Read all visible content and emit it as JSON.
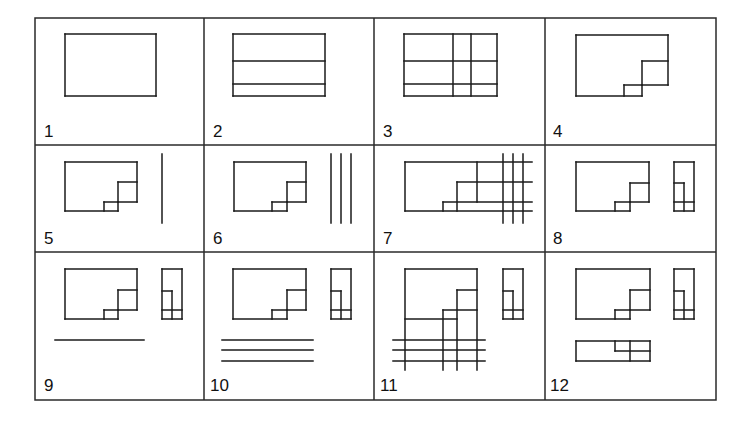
{
  "figure": {
    "grid": {
      "x": 35,
      "y": 18,
      "width": 681,
      "height": 382,
      "col_lines": [
        204,
        374,
        545
      ],
      "row_lines": [
        145,
        252
      ]
    },
    "panels": [
      {
        "label": "1",
        "label_pos": [
          44,
          137
        ],
        "lines": [
          [
            65,
            34,
            156,
            34
          ],
          [
            156,
            34,
            156,
            96
          ],
          [
            156,
            96,
            65,
            96
          ],
          [
            65,
            96,
            65,
            34
          ]
        ]
      },
      {
        "label": "2",
        "label_pos": [
          213,
          137
        ],
        "lines": [
          [
            233,
            34,
            325,
            34
          ],
          [
            325,
            34,
            325,
            96
          ],
          [
            325,
            96,
            233,
            96
          ],
          [
            233,
            96,
            233,
            34
          ],
          [
            233,
            61,
            325,
            61
          ],
          [
            233,
            84,
            325,
            84
          ]
        ]
      },
      {
        "label": "3",
        "label_pos": [
          383,
          137
        ],
        "lines": [
          [
            404,
            34,
            497,
            34
          ],
          [
            497,
            34,
            497,
            96
          ],
          [
            497,
            96,
            404,
            96
          ],
          [
            404,
            96,
            404,
            34
          ],
          [
            404,
            61,
            497,
            61
          ],
          [
            404,
            84,
            497,
            84
          ],
          [
            453,
            34,
            453,
            96
          ],
          [
            471,
            34,
            471,
            96
          ]
        ]
      },
      {
        "label": "4",
        "label_pos": [
          553,
          137
        ],
        "lines": [
          [
            576,
            35,
            668,
            35
          ],
          [
            668,
            35,
            668,
            85
          ],
          [
            642,
            61,
            668,
            61
          ],
          [
            642,
            61,
            642,
            96
          ],
          [
            642,
            85,
            668,
            85
          ],
          [
            624,
            85,
            642,
            85
          ],
          [
            624,
            85,
            624,
            96
          ],
          [
            576,
            96,
            642,
            96
          ],
          [
            576,
            35,
            576,
            96
          ]
        ]
      },
      {
        "label": "5",
        "label_pos": [
          44,
          244
        ],
        "lines": [
          [
            65,
            162,
            137,
            162
          ],
          [
            137,
            162,
            137,
            202
          ],
          [
            118,
            182,
            137,
            182
          ],
          [
            118,
            182,
            118,
            211
          ],
          [
            118,
            202,
            137,
            202
          ],
          [
            104,
            202,
            118,
            202
          ],
          [
            104,
            202,
            104,
            211
          ],
          [
            65,
            211,
            118,
            211
          ],
          [
            65,
            162,
            65,
            211
          ],
          [
            162,
            154,
            162,
            223
          ]
        ]
      },
      {
        "label": "6",
        "label_pos": [
          213,
          244
        ],
        "lines": [
          [
            234,
            162,
            306,
            162
          ],
          [
            306,
            162,
            306,
            202
          ],
          [
            287,
            182,
            306,
            182
          ],
          [
            287,
            182,
            287,
            211
          ],
          [
            287,
            202,
            306,
            202
          ],
          [
            272,
            202,
            287,
            202
          ],
          [
            272,
            202,
            272,
            211
          ],
          [
            234,
            211,
            287,
            211
          ],
          [
            234,
            162,
            234,
            211
          ],
          [
            331,
            154,
            331,
            223
          ],
          [
            341,
            154,
            341,
            223
          ],
          [
            351,
            154,
            351,
            223
          ]
        ]
      },
      {
        "label": "7",
        "label_pos": [
          383,
          244
        ],
        "lines": [
          [
            405,
            162,
            532,
            162
          ],
          [
            477,
            162,
            477,
            202
          ],
          [
            457,
            182,
            532,
            182
          ],
          [
            457,
            182,
            457,
            211
          ],
          [
            443,
            202,
            532,
            202
          ],
          [
            443,
            202,
            443,
            211
          ],
          [
            405,
            211,
            532,
            211
          ],
          [
            405,
            162,
            405,
            211
          ],
          [
            503,
            154,
            503,
            223
          ],
          [
            513,
            154,
            513,
            223
          ],
          [
            523,
            154,
            523,
            223
          ]
        ]
      },
      {
        "label": "8",
        "label_pos": [
          553,
          244
        ],
        "lines": [
          [
            576,
            162,
            649,
            162
          ],
          [
            649,
            162,
            649,
            202
          ],
          [
            630,
            183,
            649,
            183
          ],
          [
            630,
            183,
            630,
            211
          ],
          [
            630,
            202,
            649,
            202
          ],
          [
            615,
            202,
            630,
            202
          ],
          [
            615,
            202,
            615,
            211
          ],
          [
            576,
            211,
            630,
            211
          ],
          [
            576,
            162,
            576,
            211
          ],
          [
            674,
            162,
            694,
            162
          ],
          [
            694,
            162,
            694,
            211
          ],
          [
            674,
            211,
            694,
            211
          ],
          [
            674,
            162,
            674,
            211
          ],
          [
            674,
            183,
            684,
            183
          ],
          [
            684,
            183,
            684,
            211
          ],
          [
            674,
            202,
            694,
            202
          ]
        ]
      },
      {
        "label": "9",
        "label_pos": [
          44,
          391
        ],
        "lines": [
          [
            65,
            269,
            137,
            269
          ],
          [
            137,
            269,
            137,
            310
          ],
          [
            118,
            290,
            137,
            290
          ],
          [
            118,
            290,
            118,
            319
          ],
          [
            118,
            310,
            137,
            310
          ],
          [
            104,
            310,
            118,
            310
          ],
          [
            104,
            310,
            104,
            319
          ],
          [
            65,
            319,
            118,
            319
          ],
          [
            65,
            269,
            65,
            319
          ],
          [
            162,
            269,
            182,
            269
          ],
          [
            182,
            269,
            182,
            319
          ],
          [
            162,
            319,
            182,
            319
          ],
          [
            162,
            269,
            162,
            319
          ],
          [
            162,
            291,
            172,
            291
          ],
          [
            172,
            291,
            172,
            319
          ],
          [
            162,
            310,
            182,
            310
          ],
          [
            55,
            340,
            144,
            340
          ]
        ]
      },
      {
        "label": "10",
        "label_pos": [
          210,
          391
        ],
        "lines": [
          [
            233,
            269,
            306,
            269
          ],
          [
            306,
            269,
            306,
            310
          ],
          [
            287,
            290,
            306,
            290
          ],
          [
            287,
            290,
            287,
            319
          ],
          [
            287,
            310,
            306,
            310
          ],
          [
            272,
            310,
            287,
            310
          ],
          [
            272,
            310,
            272,
            319
          ],
          [
            233,
            319,
            287,
            319
          ],
          [
            233,
            269,
            233,
            319
          ],
          [
            331,
            269,
            351,
            269
          ],
          [
            351,
            269,
            351,
            319
          ],
          [
            331,
            319,
            351,
            319
          ],
          [
            331,
            269,
            331,
            319
          ],
          [
            331,
            291,
            341,
            291
          ],
          [
            341,
            291,
            341,
            319
          ],
          [
            331,
            310,
            351,
            310
          ],
          [
            222,
            340,
            313,
            340
          ],
          [
            222,
            350,
            313,
            350
          ],
          [
            222,
            361,
            313,
            361
          ]
        ]
      },
      {
        "label": "11",
        "label_pos": [
          380,
          391
        ],
        "lines": [
          [
            405,
            269,
            477,
            269
          ],
          [
            477,
            269,
            477,
            370
          ],
          [
            457,
            290,
            477,
            290
          ],
          [
            457,
            290,
            457,
            370
          ],
          [
            443,
            310,
            477,
            310
          ],
          [
            443,
            310,
            443,
            370
          ],
          [
            405,
            319,
            457,
            319
          ],
          [
            405,
            269,
            405,
            370
          ],
          [
            503,
            269,
            523,
            269
          ],
          [
            523,
            269,
            523,
            319
          ],
          [
            503,
            319,
            523,
            319
          ],
          [
            503,
            269,
            503,
            319
          ],
          [
            503,
            291,
            513,
            291
          ],
          [
            513,
            291,
            513,
            319
          ],
          [
            503,
            310,
            523,
            310
          ],
          [
            393,
            340,
            485,
            340
          ],
          [
            393,
            350,
            485,
            350
          ],
          [
            393,
            361,
            485,
            361
          ]
        ]
      },
      {
        "label": "12",
        "label_pos": [
          550,
          391
        ],
        "lines": [
          [
            576,
            269,
            650,
            269
          ],
          [
            650,
            269,
            650,
            310
          ],
          [
            630,
            290,
            650,
            290
          ],
          [
            630,
            290,
            630,
            319
          ],
          [
            630,
            310,
            650,
            310
          ],
          [
            615,
            310,
            630,
            310
          ],
          [
            615,
            310,
            615,
            319
          ],
          [
            576,
            319,
            630,
            319
          ],
          [
            576,
            269,
            576,
            319
          ],
          [
            674,
            269,
            694,
            269
          ],
          [
            694,
            269,
            694,
            319
          ],
          [
            674,
            319,
            694,
            319
          ],
          [
            674,
            269,
            674,
            319
          ],
          [
            674,
            291,
            684,
            291
          ],
          [
            684,
            291,
            684,
            319
          ],
          [
            674,
            310,
            694,
            310
          ],
          [
            576,
            341,
            650,
            341
          ],
          [
            650,
            341,
            650,
            361
          ],
          [
            576,
            361,
            650,
            361
          ],
          [
            576,
            341,
            576,
            361
          ],
          [
            615,
            341,
            615,
            351
          ],
          [
            615,
            351,
            650,
            351
          ],
          [
            630,
            341,
            630,
            361
          ]
        ]
      }
    ]
  }
}
